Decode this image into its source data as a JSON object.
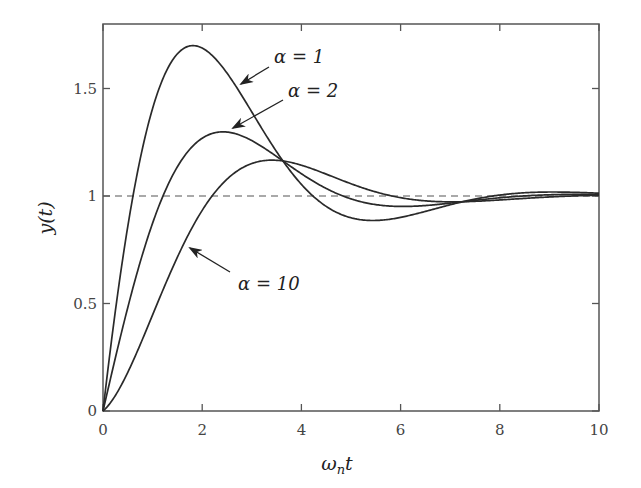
{
  "chart_data": {
    "type": "line",
    "title": "",
    "xlabel": "ω_n t",
    "ylabel": "y(t)",
    "xlim": [
      0,
      10
    ],
    "ylim": [
      0,
      1.8
    ],
    "xticks": [
      0,
      2,
      4,
      6,
      8,
      10
    ],
    "yticks": [
      0,
      0.5,
      1,
      1.5
    ],
    "xtick_labels": [
      "0",
      "2",
      "4",
      "6",
      "8",
      "10"
    ],
    "ytick_labels": [
      "0",
      "0.5",
      "1",
      "1.5"
    ],
    "grid": false,
    "legend": "none (inline arrow annotations)",
    "reference_line": {
      "y": 1,
      "style": "dashed"
    },
    "x": [
      0,
      0.5,
      1,
      1.5,
      2,
      2.5,
      3,
      3.5,
      4,
      4.5,
      5,
      5.5,
      6,
      6.5,
      7,
      7.5,
      8,
      8.5,
      9,
      9.5,
      10
    ],
    "series": [
      {
        "name": "α = 1",
        "values": [
          0,
          0.88,
          1.46,
          1.7,
          1.68,
          1.5,
          1.28,
          1.1,
          0.98,
          0.92,
          0.91,
          0.93,
          0.96,
          0.99,
          1.01,
          1.02,
          1.02,
          1.02,
          1.01,
          1.01,
          1.0
        ]
      },
      {
        "name": "α = 2",
        "values": [
          0,
          0.5,
          0.94,
          1.18,
          1.29,
          1.29,
          1.23,
          1.15,
          1.08,
          1.02,
          0.99,
          0.97,
          0.97,
          0.98,
          0.99,
          1.0,
          1.01,
          1.01,
          1.01,
          1.01,
          1.0
        ]
      },
      {
        "name": "α = 10",
        "values": [
          0,
          0.19,
          0.51,
          0.79,
          0.99,
          1.11,
          1.16,
          1.17,
          1.14,
          1.1,
          1.06,
          1.02,
          1.0,
          0.99,
          0.99,
          0.99,
          1.0,
          1.0,
          1.0,
          1.0,
          1.0
        ]
      }
    ],
    "model": {
      "zeta": 0.5,
      "omega_n": 1,
      "alphas": [
        1,
        2,
        10
      ]
    },
    "annotations": [
      {
        "text": "α = 1",
        "target_series": "α = 1"
      },
      {
        "text": "α = 2",
        "target_series": "α = 2"
      },
      {
        "text": "α = 10",
        "target_series": "α = 10"
      }
    ]
  },
  "labels": {
    "xlabel_main": "ω",
    "xlabel_sub": "n",
    "xlabel_tail": "t",
    "ylabel": "y(t)",
    "alpha1": "α = 1",
    "alpha2": "α = 2",
    "alpha10": "α = 10"
  },
  "colors": {
    "curve": "#2a2a2a",
    "axis": "#555555",
    "dashed": "#555555"
  }
}
